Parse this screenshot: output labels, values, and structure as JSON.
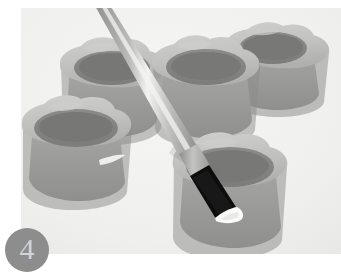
{
  "step": {
    "number": "4",
    "badge_color": "#8d8d8d",
    "numeral_color": "#d3d3d3"
  },
  "photo": {
    "alt": "Grayscale photo of five scalloped-rim paint pots with a flat paintbrush applying white paint to one pot rim",
    "background_color": "#f2f2f1",
    "frame": {
      "left": 21,
      "top": 8,
      "width": 320,
      "height": 246
    },
    "palette": {
      "pot_rim_light": "#c9c9c7",
      "pot_rim_mid": "#b2b2b0",
      "pot_body": "#9a9a98",
      "pot_interior_dark": "#7f7f7d",
      "pot_shadow": "#8a8a88",
      "brush_handle": "#9e9e9c",
      "brush_handle_highlight": "#e9e9e7",
      "brush_ferrule": "#a9a9a7",
      "brush_bristles": "#101010",
      "paint_white": "#fbfbfa"
    },
    "objects": [
      {
        "name": "pot-top-left",
        "label": "Paint pot (top left)"
      },
      {
        "name": "pot-top-center",
        "label": "Paint pot (top center)"
      },
      {
        "name": "pot-top-right",
        "label": "Paint pot (top right)"
      },
      {
        "name": "pot-bottom-left",
        "label": "Paint pot (bottom left)"
      },
      {
        "name": "pot-bottom-right",
        "label": "Paint pot (bottom right, being painted)"
      },
      {
        "name": "paintbrush",
        "label": "Flat paintbrush with white paint on tip"
      }
    ]
  }
}
